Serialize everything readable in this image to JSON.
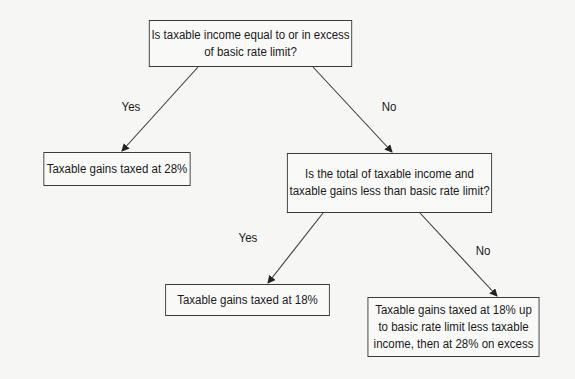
{
  "diagram": {
    "type": "decision-flowchart",
    "nodes": [
      {
        "id": "q1",
        "kind": "decision",
        "lines": [
          "Is taxable income equal to or in excess",
          "of basic rate limit?"
        ]
      },
      {
        "id": "r1",
        "kind": "outcome",
        "lines": [
          "Taxable gains taxed at 28%"
        ]
      },
      {
        "id": "q2",
        "kind": "decision",
        "lines": [
          "Is the total of taxable income and",
          "taxable gains less than basic rate limit?"
        ]
      },
      {
        "id": "r2",
        "kind": "outcome",
        "lines": [
          "Taxable gains taxed at 18%"
        ]
      },
      {
        "id": "r3",
        "kind": "outcome",
        "lines": [
          "Taxable gains taxed at 18% up",
          "to basic rate limit less taxable",
          "income, then at 28% on excess"
        ]
      }
    ],
    "edges": [
      {
        "from": "q1",
        "to": "r1",
        "label": "Yes"
      },
      {
        "from": "q1",
        "to": "q2",
        "label": "No"
      },
      {
        "from": "q2",
        "to": "r2",
        "label": "Yes"
      },
      {
        "from": "q2",
        "to": "r3",
        "label": "No"
      }
    ],
    "colors": {
      "line": "#3a3a3a",
      "background": "#f6f6f4",
      "text": "#1a1a1a"
    }
  }
}
